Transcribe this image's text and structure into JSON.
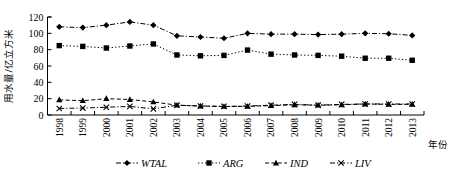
{
  "chart_data": {
    "type": "line",
    "title": "",
    "xlabel": "年份",
    "ylabel": "用水量/亿立方米",
    "categories": [
      "1998",
      "1999",
      "2000",
      "2001",
      "2002",
      "2003",
      "2004",
      "2005",
      "2006",
      "2007",
      "2008",
      "2009",
      "2010",
      "2011",
      "2012",
      "2013"
    ],
    "ylim": [
      0,
      120
    ],
    "yticks": [
      0,
      20,
      40,
      60,
      80,
      100,
      120
    ],
    "grid": false,
    "legend_position": "bottom",
    "series": [
      {
        "name": "WTAL",
        "marker": "diamond",
        "linestyle": "dash-dot",
        "values": [
          108,
          107,
          110,
          114,
          110,
          97,
          95.5,
          94,
          100,
          99,
          99,
          98.5,
          99,
          100,
          99.5,
          97.5
        ]
      },
      {
        "name": "ARG",
        "marker": "square",
        "linestyle": "dotted",
        "values": [
          85,
          84,
          82,
          84.5,
          87,
          73.5,
          72.5,
          73,
          79.5,
          74.5,
          73.5,
          73,
          72,
          69.5,
          69.5,
          67
        ]
      },
      {
        "name": "IND",
        "marker": "triangle",
        "linestyle": "dashed",
        "values": [
          18.5,
          17.5,
          20,
          19,
          16,
          12,
          11,
          10.5,
          10.5,
          11.5,
          12.5,
          12,
          12.5,
          13.5,
          13,
          13
        ]
      },
      {
        "name": "LIV",
        "marker": "x",
        "linestyle": "dash-dot",
        "values": [
          8,
          8.5,
          9.5,
          10.5,
          7.5,
          12,
          11,
          10.5,
          11,
          12,
          13,
          12,
          13,
          13.5,
          13.5,
          13.5
        ]
      }
    ]
  },
  "axis": {
    "y_title": "用水量/亿立方米",
    "x_title": "年份"
  },
  "legend": {
    "items": [
      {
        "label": "WTAL"
      },
      {
        "label": "ARG"
      },
      {
        "label": "IND"
      },
      {
        "label": "LIV"
      }
    ]
  }
}
